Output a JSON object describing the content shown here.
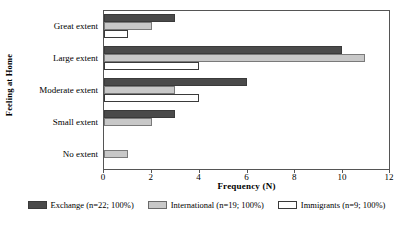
{
  "chart_data": {
    "type": "bar",
    "orientation": "horizontal",
    "title": "",
    "xlabel": "Frequency (N)",
    "ylabel": "Feeling at Home",
    "categories": [
      "Great extent",
      "Large extent",
      "Moderate extent",
      "Small extent",
      "No extent"
    ],
    "series": [
      {
        "name": "Exchange (n=22; 100%)",
        "color": "#4a4a4a",
        "values": [
          3,
          10,
          6,
          3,
          0
        ]
      },
      {
        "name": "International (n=19; 100%)",
        "color": "#c8c8c8",
        "values": [
          2,
          11,
          3,
          2,
          1
        ]
      },
      {
        "name": "Immigrants (n=9; 100%)",
        "color": "#ffffff",
        "values": [
          1,
          4,
          4,
          0,
          0
        ]
      }
    ],
    "xlim": [
      0,
      12
    ],
    "xticks": [
      0,
      2,
      4,
      6,
      8,
      10,
      12
    ],
    "xtick_labels": [
      "0",
      "2",
      "4",
      "6",
      "8",
      "10",
      "12"
    ],
    "grid": false,
    "legend_position": "bottom"
  },
  "axes": {
    "y_title": "Feeling at Home",
    "x_title": "Frequency (N)"
  },
  "categories": {
    "c0": "Great extent",
    "c1": "Large extent",
    "c2": "Moderate extent",
    "c3": "Small extent",
    "c4": "No extent"
  },
  "xticks": {
    "t0": "0",
    "t1": "2",
    "t2": "4",
    "t3": "6",
    "t4": "8",
    "t5": "10",
    "t6": "12"
  },
  "legend": {
    "items": [
      {
        "label": "Exchange (n=22; 100%)"
      },
      {
        "label": "International (n=19; 100%)"
      },
      {
        "label": "Immigrants (n=9; 100%)"
      }
    ]
  }
}
